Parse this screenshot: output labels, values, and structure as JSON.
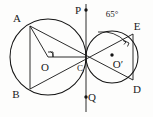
{
  "figure": {
    "background": "#fdfdfc",
    "ink": "#141414",
    "angle_label": "65°",
    "labels": {
      "A": "A",
      "B": "B",
      "C": "C",
      "D": "D",
      "E": "E",
      "P": "P",
      "Q": "Q",
      "O": "O",
      "O_prime": "O′"
    },
    "points": [
      {
        "name": "A",
        "label": "A",
        "x": 30,
        "y": 26,
        "label_x": 17,
        "label_y": 22
      },
      {
        "name": "B",
        "label": "B",
        "x": 30,
        "y": 89,
        "label_x": 16,
        "label_y": 98
      },
      {
        "name": "C",
        "label": "C",
        "x": 86,
        "y": 57,
        "label_x": 80,
        "label_y": 70
      },
      {
        "name": "D",
        "label": "D",
        "x": 133,
        "y": 80,
        "label_x": 135,
        "label_y": 92
      },
      {
        "name": "E",
        "label": "E",
        "x": 133,
        "y": 34,
        "label_x": 134,
        "label_y": 30
      },
      {
        "name": "P",
        "label": "P",
        "x": 86,
        "y": 10,
        "label_x": 76,
        "label_y": 13
      },
      {
        "name": "Q",
        "label": "Q",
        "x": 86,
        "y": 97,
        "label_x": 88,
        "label_y": 101
      },
      {
        "name": "O",
        "label": "O",
        "x": 48,
        "y": 57,
        "label_x": 44,
        "label_y": 70
      },
      {
        "name": "O_prime",
        "label": "O′",
        "x": 112,
        "y": 55,
        "label_x": 114,
        "label_y": 68
      }
    ],
    "circles": [
      {
        "name": "big-circle",
        "cx": 48,
        "cy": 57,
        "r": 38
      },
      {
        "name": "small-circle",
        "cx": 112,
        "cy": 57,
        "r": 26
      }
    ],
    "segments": [
      {
        "name": "chord-AB",
        "x1": 30,
        "y1": 26,
        "x2": 30,
        "y2": 89
      },
      {
        "name": "segment-AC",
        "x1": 30,
        "y1": 26,
        "x2": 86,
        "y2": 57
      },
      {
        "name": "segment-AO",
        "x1": 30,
        "y1": 26,
        "x2": 48,
        "y2": 57
      },
      {
        "name": "segment-OC",
        "x1": 48,
        "y1": 57,
        "x2": 86,
        "y2": 57
      },
      {
        "name": "segment-BC-extended-E",
        "x1": 30,
        "y1": 89,
        "x2": 133,
        "y2": 34
      },
      {
        "name": "segment-AC-extended-D",
        "x1": 30,
        "y1": 26,
        "x2": 133,
        "y2": 80
      },
      {
        "name": "chord-ED",
        "x1": 133,
        "y1": 34,
        "x2": 133,
        "y2": 80
      },
      {
        "name": "segment-CE",
        "x1": 86,
        "y1": 57,
        "x2": 133,
        "y2": 34
      },
      {
        "name": "segment-CD",
        "x1": 86,
        "y1": 57,
        "x2": 133,
        "y2": 80
      },
      {
        "name": "tangent-line-PQ",
        "x1": 86,
        "y1": 4,
        "x2": 86,
        "y2": 112
      }
    ],
    "marks": [
      {
        "name": "right-angle-at-O",
        "type": "right-angle"
      },
      {
        "name": "right-angle-at-E",
        "type": "right-angle"
      },
      {
        "name": "angle-arc-65",
        "type": "arc",
        "value": "65°",
        "label_x": 104,
        "label_y": 16
      }
    ]
  }
}
